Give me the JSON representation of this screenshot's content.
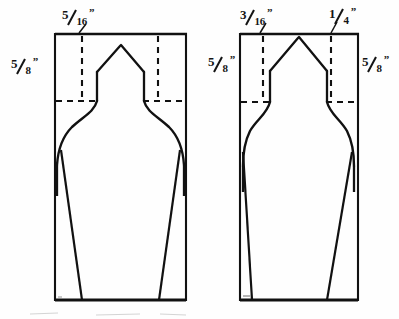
{
  "figure": {
    "ink_color": "#111111",
    "paper_color": "#fefefe",
    "line_style_solid": "solid outline",
    "line_style_dashed": "dashed construction line"
  },
  "left_figure": {
    "name": "left-pattern",
    "dimensions": [
      {
        "id": "left-top-width",
        "numerator": "5",
        "denominator": "16",
        "inch_mark": "”",
        "position": "top-left-above-rectangle"
      },
      {
        "id": "left-side-height",
        "numerator": "5",
        "denominator": "8",
        "inch_mark": "”",
        "position": "left-of-rectangle"
      }
    ]
  },
  "right_figure": {
    "name": "right-pattern",
    "dimensions": [
      {
        "id": "right-top-left-width",
        "numerator": "3",
        "denominator": "16",
        "inch_mark": "”",
        "position": "top-left-above-rectangle"
      },
      {
        "id": "right-top-right-width",
        "numerator": "1",
        "denominator": "4",
        "inch_mark": "”",
        "position": "top-right-above-rectangle"
      },
      {
        "id": "right-left-height",
        "numerator": "5",
        "denominator": "8",
        "inch_mark": "”",
        "position": "left-of-rectangle"
      },
      {
        "id": "right-right-height",
        "numerator": "5",
        "denominator": "8",
        "inch_mark": "”",
        "position": "right-of-rectangle"
      }
    ]
  }
}
